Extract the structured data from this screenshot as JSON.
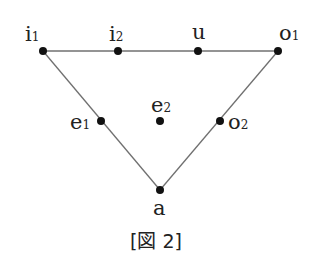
{
  "diagram": {
    "caption": "[図 2]",
    "line_color": "#707070",
    "point_color": "#111111",
    "points": {
      "i1": {
        "base": "i",
        "sub": "1"
      },
      "i2": {
        "base": "i",
        "sub": "2"
      },
      "u": {
        "base": "u",
        "sub": ""
      },
      "o1": {
        "base": "o",
        "sub": "1"
      },
      "e1": {
        "base": "e",
        "sub": "1"
      },
      "e2": {
        "base": "e",
        "sub": "2"
      },
      "o2": {
        "base": "o",
        "sub": "2"
      },
      "a": {
        "base": "a",
        "sub": ""
      }
    }
  }
}
